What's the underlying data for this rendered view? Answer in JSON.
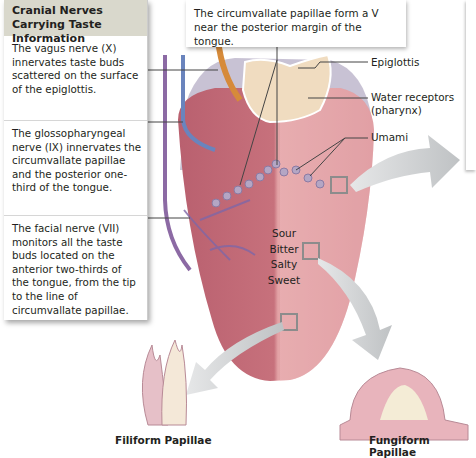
{
  "title": "Cranial Nerves Carrying Taste Information",
  "left_panel": {
    "header": "Cranial Nerves Carrying Taste Information",
    "sections": [
      {
        "nerve": "vagus",
        "text": "The vagus nerve (X) innervates taste buds scattered on the surface of the epiglottis."
      },
      {
        "nerve": "glossopharyngeal",
        "text": "The glossopharyngeal nerve (IX) innervates the circumvallate papillae and the posterior one-third of the tongue."
      },
      {
        "nerve": "facial",
        "text": "The facial nerve (VII) monitors all the taste buds located on the anterior two-thirds of the tongue, from the tip to the line of circumvallate papillae."
      }
    ]
  },
  "top_callout": "The circumvallate papillae form a V near the posterior margin of the tongue.",
  "labels": {
    "epiglottis": "Epiglottis",
    "water_receptors": "Water receptors",
    "water_receptors_sub": "(pharynx)",
    "umami": "Umami"
  },
  "tastes": [
    "Sour",
    "Bitter",
    "Salty",
    "Sweet"
  ],
  "captions": {
    "filiform": "Filiform Papillae",
    "fungiform": "Fungiform Papillae"
  },
  "colors": {
    "panel_header": "#d9d8cc",
    "tongue_left": "#c9707e",
    "tongue_right": "#e2a0a4",
    "nerve_vagus": "#8a6aa0",
    "nerve_blue": "#6a80b8",
    "arrow": "#c9cccd"
  }
}
